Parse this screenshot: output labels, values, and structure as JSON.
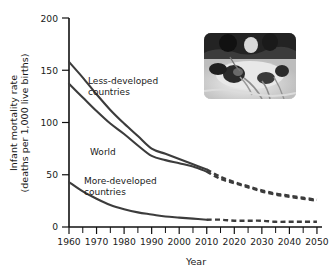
{
  "chart_data": {
    "type": "line",
    "title": "",
    "xlabel": "Year",
    "ylabel": "Infant mortality rate (deaths per 1,000 live births)",
    "ylabel_line1": "Infant mortality rate",
    "ylabel_line2": "(deaths per 1,000 live births)",
    "xlim": [
      1960,
      2050
    ],
    "ylim": [
      0,
      200
    ],
    "xticks": [
      1960,
      1970,
      1980,
      1990,
      2000,
      2010,
      2020,
      2030,
      2040,
      2050
    ],
    "xtick_labels": [
      "1960",
      "1970",
      "1980",
      "1990",
      "2000",
      "2010",
      "2020",
      "2030",
      "2040",
      "2050"
    ],
    "xticks_minor": [
      1965,
      1975,
      1985,
      1995,
      2005,
      2015,
      2025,
      2035,
      2045
    ],
    "yticks": [
      0,
      50,
      100,
      150,
      200
    ],
    "ytick_labels": [
      "0",
      "50",
      "100",
      "150",
      "200"
    ],
    "grid": false,
    "legend": "inline-labels",
    "projection_starts": 2010,
    "line_color": "#3c3c3c",
    "x": [
      1960,
      1965,
      1970,
      1975,
      1980,
      1985,
      1990,
      1995,
      2000,
      2005,
      2010,
      2015,
      2020,
      2025,
      2030,
      2035,
      2040,
      2045,
      2050
    ],
    "series": [
      {
        "name": "Less-developed countries",
        "label": "Less-developed countries",
        "label_line1": "Less-developed",
        "label_line2": "countries",
        "values": [
          158,
          143,
          127,
          112,
          99,
          87,
          75,
          70,
          65,
          60,
          55,
          48,
          43,
          39,
          35,
          32,
          30,
          28,
          26
        ]
      },
      {
        "name": "World",
        "label": "World",
        "label_line1": "World",
        "label_line2": "",
        "values": [
          137,
          124,
          111,
          99,
          89,
          78,
          68,
          64,
          61,
          58,
          53,
          46,
          42,
          38,
          34,
          31,
          29,
          27,
          25
        ]
      },
      {
        "name": "More-developed countries",
        "label": "More-developed countries",
        "label_line1": "More-developed",
        "label_line2": "countries",
        "values": [
          43,
          34,
          27,
          21,
          17,
          14,
          12,
          10,
          9,
          8,
          7,
          7,
          6,
          6,
          6,
          5,
          5,
          5,
          5
        ]
      }
    ]
  },
  "inset": {
    "name": "neonatal-infant-photo",
    "alt": "Photograph of a newborn infant receiving neonatal intensive care"
  }
}
